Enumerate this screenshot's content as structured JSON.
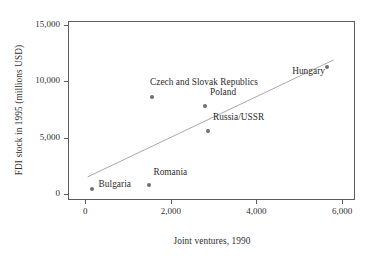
{
  "chart_data": {
    "type": "scatter",
    "title": "",
    "xlabel": "Joint ventures, 1990",
    "ylabel": "FDI stock in 1995 (millions USD)",
    "xlim": [
      -400,
      6300
    ],
    "ylim": [
      -500,
      15350
    ],
    "xticks": [
      0,
      2000,
      4000,
      6000
    ],
    "xticklabels": [
      "0",
      "2,000",
      "4,000",
      "6,000"
    ],
    "yticks": [
      0,
      5000,
      10000,
      15000
    ],
    "yticklabels": [
      "0",
      "5,000",
      "10,000",
      "15,000"
    ],
    "grid": false,
    "legend": "none",
    "marker_color": "#6e6e6e",
    "line_color": "#a8a8a8",
    "axis_color": "#5c5c5c",
    "points": [
      {
        "label": "Bulgaria",
        "x": 150,
        "y": 450,
        "label_dx": 7,
        "label_dy": -4
      },
      {
        "label": "Romania",
        "x": 1500,
        "y": 800,
        "label_dx": 4,
        "label_dy": -12
      },
      {
        "label": "Czech and Slovak Republics",
        "x": 1560,
        "y": 8600,
        "label_dx": -2,
        "label_dy": -14
      },
      {
        "label": "Poland",
        "x": 2800,
        "y": 7800,
        "label_dx": 5,
        "label_dy": -13
      },
      {
        "label": "Russia/USSR",
        "x": 2870,
        "y": 5600,
        "label_dx": 5,
        "label_dy": -13
      },
      {
        "label": "Hungary",
        "x": 5650,
        "y": 11300,
        "label_dx": -35,
        "label_dy": 5
      }
    ],
    "trendline": {
      "x_start": 60,
      "y_start": 1550,
      "x_end": 5800,
      "y_end": 11900
    }
  }
}
